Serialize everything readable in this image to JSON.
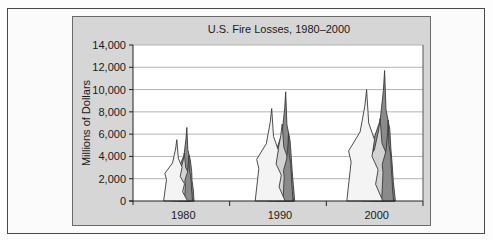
{
  "chart_data": {
    "type": "bar",
    "subtype": "pictorial-flames",
    "title": "U.S. Fire Losses, 1980–2000",
    "xlabel": "",
    "ylabel": "Millions of Dollars",
    "categories": [
      "1980",
      "1990",
      "2000"
    ],
    "series": [
      {
        "name": "Total losses (tallest flame)",
        "values": [
          6600,
          9800,
          11700
        ],
        "color": "#8a8a8a"
      },
      {
        "name": "Front flame peak",
        "values": [
          5500,
          8300,
          10000
        ],
        "color": "#f4f4f4"
      }
    ],
    "middle_flame_peaks": [
      4300,
      6900,
      7400
    ],
    "ylim": [
      0,
      14000
    ],
    "yticks": [
      0,
      2000,
      4000,
      6000,
      8000,
      10000,
      12000,
      14000
    ],
    "ytick_labels": [
      "0",
      "2,000",
      "4,000",
      "6,000",
      "8,000",
      "10,000",
      "12,000",
      "14,000"
    ],
    "grid": true,
    "legend": "none",
    "colors": {
      "panel": "#d6d6d6",
      "plot_bg": "#ffffff",
      "grid": "#b4b4b4",
      "flame_light": "#f4f4f4",
      "flame_mid": "#d2d2d2",
      "flame_dark": "#8a8a8a",
      "flame_stroke": "#3a3a3a"
    }
  }
}
